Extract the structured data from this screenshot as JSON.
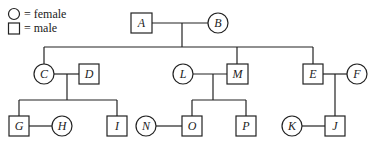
{
  "legend": {
    "female_label": "= female",
    "male_label": "= male"
  },
  "individuals": {
    "A": {
      "label": "A",
      "sex": "male"
    },
    "B": {
      "label": "B",
      "sex": "female"
    },
    "C": {
      "label": "C",
      "sex": "female"
    },
    "D": {
      "label": "D",
      "sex": "male"
    },
    "E": {
      "label": "E",
      "sex": "male"
    },
    "F": {
      "label": "F",
      "sex": "female"
    },
    "G": {
      "label": "G",
      "sex": "male"
    },
    "H": {
      "label": "H",
      "sex": "female"
    },
    "I": {
      "label": "I",
      "sex": "male"
    },
    "J": {
      "label": "J",
      "sex": "male"
    },
    "K": {
      "label": "K",
      "sex": "female"
    },
    "L": {
      "label": "L",
      "sex": "female"
    },
    "M": {
      "label": "M",
      "sex": "male"
    },
    "N": {
      "label": "N",
      "sex": "female"
    },
    "O": {
      "label": "O",
      "sex": "male"
    },
    "P": {
      "label": "P",
      "sex": "male"
    }
  },
  "relationships": {
    "couples": [
      [
        "A",
        "B"
      ],
      [
        "C",
        "D"
      ],
      [
        "L",
        "M"
      ],
      [
        "E",
        "F"
      ],
      [
        "G",
        "H"
      ],
      [
        "N",
        "O"
      ],
      [
        "K",
        "J"
      ]
    ],
    "children": {
      "A+B": [
        "C",
        "M",
        "E"
      ],
      "C+D": [
        "G",
        "I"
      ],
      "L+M": [
        "O",
        "P"
      ],
      "E+F": [
        "J"
      ]
    }
  }
}
